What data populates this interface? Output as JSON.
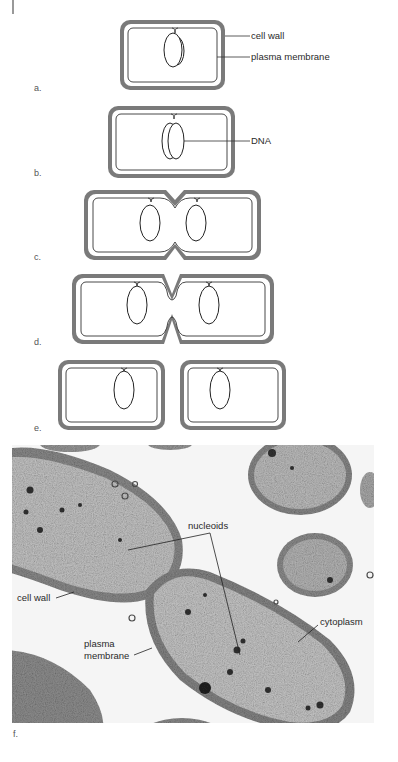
{
  "figure": {
    "panels": [
      {
        "id": "a",
        "label": "a.",
        "callouts": [
          "cell wall",
          "plasma membrane"
        ]
      },
      {
        "id": "b",
        "label": "b.",
        "callouts": [
          "DNA"
        ]
      },
      {
        "id": "c",
        "label": "c.",
        "callouts": []
      },
      {
        "id": "d",
        "label": "d.",
        "callouts": []
      },
      {
        "id": "e",
        "label": "e.",
        "callouts": []
      },
      {
        "id": "f",
        "label": "f.",
        "callouts": [
          "nucleoids",
          "cell wall",
          "plasma membrane",
          "cytoplasm"
        ]
      }
    ],
    "labels": {
      "cell_wall": "cell wall",
      "plasma_membrane": "plasma membrane",
      "dna": "DNA",
      "nucleoids": "nucleoids",
      "photo_cell_wall": "cell wall",
      "photo_plasma": "plasma",
      "photo_membrane": "membrane",
      "cytoplasm": "cytoplasm"
    },
    "colors": {
      "cell_wall": "#7a7a7a",
      "membrane": "#333333",
      "photo_background": "#f4f4f4"
    }
  }
}
